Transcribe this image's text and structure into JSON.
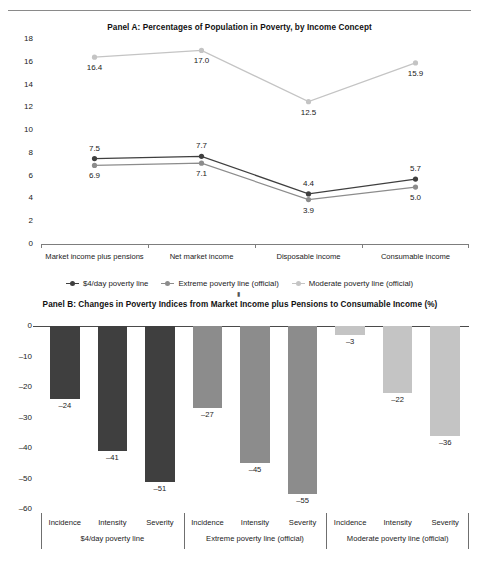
{
  "figure": {
    "panelA_title": "Panel A: Percentages of Population in Poverty, by Income Concept",
    "panelB_title": "Panel B: Changes in Poverty Indices from Market Income plus Pensions to Consumable Income (%)"
  },
  "colors": {
    "dark": "#3f3f3f",
    "medium": "#8c8c8c",
    "light": "#c4c4c4",
    "axis": "#7d7d7d",
    "text": "#1a1a1a"
  },
  "legend": {
    "items": [
      {
        "label": "$4/day poverty line",
        "color": "#3f3f3f"
      },
      {
        "label": "Extreme poverty line (official)",
        "color": "#8c8c8c"
      },
      {
        "label": "Moderate poverty line (official)",
        "color": "#c4c4c4"
      }
    ]
  },
  "chart_data": [
    {
      "type": "line",
      "title": "Panel A: Percentages of Population in Poverty, by Income Concept",
      "xlabel": "",
      "ylabel": "",
      "ylim": [
        0,
        18
      ],
      "yticks": [
        0,
        2,
        4,
        6,
        8,
        10,
        12,
        14,
        16,
        18
      ],
      "ytick_labels": [
        "0",
        "2",
        "4",
        "6",
        "8",
        "10",
        "12",
        "14",
        "16",
        "18"
      ],
      "grid": false,
      "legend_position": "bottom",
      "categories": [
        "Market income plus pensions",
        "Net market income",
        "Disposable income",
        "Consumable income"
      ],
      "series": [
        {
          "name": "$4/day poverty line",
          "color": "#3f3f3f",
          "values": [
            7.5,
            7.7,
            4.4,
            5.7
          ],
          "labels": [
            "7.5",
            "7.7",
            "4.4",
            "5.7"
          ],
          "label_pos": [
            "above",
            "above",
            "above",
            "above"
          ]
        },
        {
          "name": "Extreme poverty line (official)",
          "color": "#8c8c8c",
          "values": [
            6.9,
            7.1,
            3.9,
            5.0
          ],
          "labels": [
            "6.9",
            "7.1",
            "3.9",
            "5.0"
          ],
          "label_pos": [
            "below",
            "below",
            "below",
            "below"
          ]
        },
        {
          "name": "Moderate poverty line (official)",
          "color": "#c4c4c4",
          "values": [
            16.4,
            17.0,
            12.5,
            15.9
          ],
          "labels": [
            "16.4",
            "17.0",
            "12.5",
            "15.9"
          ],
          "label_pos": [
            "below",
            "below",
            "below",
            "below"
          ]
        }
      ]
    },
    {
      "type": "bar",
      "title": "Panel B: Changes in Poverty Indices from Market Income plus Pensions to Consumable Income (%)",
      "xlabel": "",
      "ylabel": "",
      "ylim": [
        -60,
        0
      ],
      "yticks": [
        0,
        -10,
        -20,
        -30,
        -40,
        -50,
        -60
      ],
      "ytick_labels": [
        "0",
        "–10",
        "–20",
        "–30",
        "–40",
        "–50",
        "–60"
      ],
      "grid": false,
      "categories": [
        "Incidence",
        "Intensity",
        "Severity",
        "Incidence",
        "Intensity",
        "Severity",
        "Incidence",
        "Intensity",
        "Severity"
      ],
      "groups": [
        {
          "label": "$4/day poverty line",
          "color": "#3f3f3f"
        },
        {
          "label": "Extreme poverty line (official)",
          "color": "#8c8c8c"
        },
        {
          "label": "Moderate poverty line (official)",
          "color": "#c4c4c4"
        }
      ],
      "values": [
        -24,
        -41,
        -51,
        -27,
        -45,
        -55,
        -3,
        -22,
        -36
      ],
      "value_labels": [
        "–24",
        "–41",
        "–51",
        "–27",
        "–45",
        "–55",
        "–3",
        "–22",
        "–36"
      ]
    }
  ]
}
